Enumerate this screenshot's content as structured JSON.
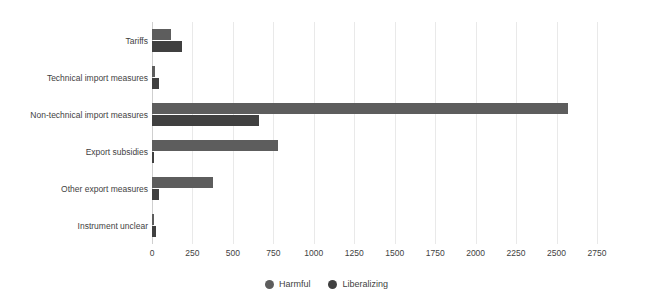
{
  "chart_data": {
    "type": "bar",
    "orientation": "horizontal",
    "title": "",
    "subtitle": "",
    "xlabel": "",
    "ylabel": "",
    "xlim": [
      0,
      2750
    ],
    "ylim": null,
    "grid": true,
    "legend_position": "bottom-center",
    "categories": [
      "Tariffs",
      "Technical import measures",
      "Non-technical import measures",
      "Export subsidies",
      "Other export measures",
      "Instrument unclear"
    ],
    "xticks": [
      0,
      250,
      500,
      750,
      1000,
      1250,
      1500,
      1750,
      2000,
      2250,
      2500,
      2750
    ],
    "xtick_labels": [
      "0",
      "250",
      "500",
      "750",
      "1000",
      "1250",
      "1500",
      "1750",
      "2000",
      "2250",
      "2500",
      "2750"
    ],
    "series": [
      {
        "name": "Harmful",
        "color": "#5d5d5d",
        "values": [
          115,
          18,
          2570,
          780,
          375,
          8
        ]
      },
      {
        "name": "Liberalizing",
        "color": "#404040",
        "values": [
          185,
          45,
          660,
          10,
          45,
          25
        ]
      }
    ]
  },
  "legend": {
    "items": [
      {
        "label": "Harmful",
        "color": "#5d5d5d",
        "icon": "circle-marker-icon"
      },
      {
        "label": "Liberalizing",
        "color": "#404040",
        "icon": "circle-marker-icon"
      }
    ]
  },
  "colors": {
    "harmful": "#5d5d5d",
    "liberalizing": "#404040",
    "grid": "#e9e9e9",
    "axis": "#cfcfcf",
    "text": "#3f3f3f",
    "background": "#ffffff"
  }
}
